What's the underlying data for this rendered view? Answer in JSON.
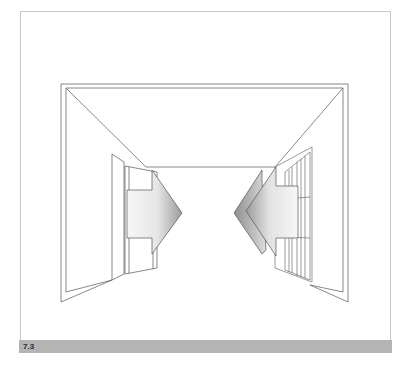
{
  "figure": {
    "caption_label": "7.3",
    "colors": {
      "frame_border": "#c8c8c8",
      "caption_bar": "#b4b4b4",
      "line": "#555555",
      "arrow_light": "#f4f4f4",
      "arrow_dark": "#9a9a9a"
    }
  }
}
